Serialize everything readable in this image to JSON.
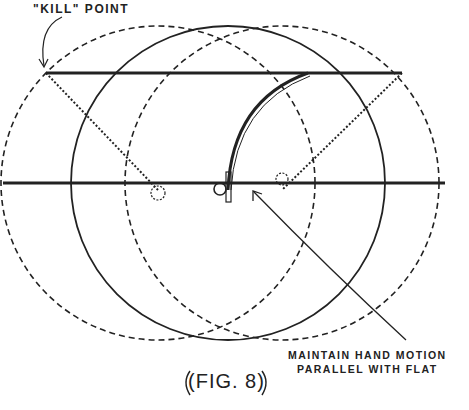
{
  "figure": {
    "caption": "(FIG. 8)",
    "labels": {
      "kill_point": "\"KILL\" POINT",
      "note_line1": "MAINTAIN HAND MOTION",
      "note_line2": "PARALLEL WITH FLAT"
    },
    "elements": {
      "circles": [
        {
          "name": "left-dashed-circle",
          "style": "dashed",
          "cx": 158,
          "cy": 183,
          "r": 157
        },
        {
          "name": "center-solid-circle",
          "style": "solid",
          "cx": 228,
          "cy": 183,
          "r": 157
        },
        {
          "name": "right-dashed-circle",
          "style": "dashed",
          "cx": 282,
          "cy": 183,
          "r": 157
        }
      ],
      "lines": [
        {
          "name": "top-flat-line",
          "y": 73
        },
        {
          "name": "base-line",
          "y": 183
        }
      ]
    },
    "colors": {
      "ink": "#222222",
      "background": "#ffffff"
    }
  }
}
